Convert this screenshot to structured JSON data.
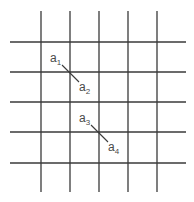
{
  "diagram": {
    "type": "grid",
    "vertical_lines": 5,
    "horizontal_lines": 5,
    "line_color": "#3a3a3a",
    "label_color": "#4a4a4a",
    "segments": [
      {
        "from": {
          "base": "a",
          "sub": "1"
        },
        "to": {
          "base": "a",
          "sub": "2"
        },
        "crosses_intersection": {
          "column": 2,
          "row": 2
        }
      },
      {
        "from": {
          "base": "a",
          "sub": "3"
        },
        "to": {
          "base": "a",
          "sub": "4"
        },
        "crosses_intersection": {
          "column": 3,
          "row": 4
        }
      }
    ]
  }
}
